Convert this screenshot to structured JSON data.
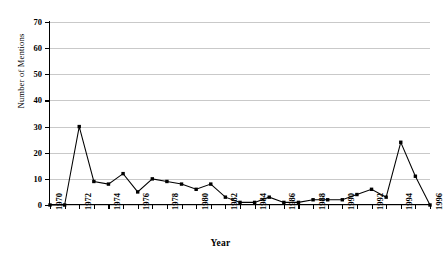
{
  "chart_data": {
    "type": "line",
    "title": "",
    "xlabel": "Year",
    "ylabel": "Number of Mentions",
    "xlim": [
      1970,
      1996
    ],
    "ylim": [
      0,
      70
    ],
    "ytick_step": 10,
    "xtick_step": 1,
    "xtick_label_step": 2,
    "grid": true,
    "legend": false,
    "marker": "filled-square",
    "line_color": "#000000",
    "grid_color": "#c9c9c9",
    "x": [
      1970,
      1971,
      1972,
      1973,
      1974,
      1975,
      1976,
      1977,
      1978,
      1979,
      1980,
      1981,
      1982,
      1983,
      1984,
      1985,
      1986,
      1987,
      1988,
      1989,
      1990,
      1991,
      1992,
      1993,
      1994,
      1995,
      1996
    ],
    "values": [
      0,
      0,
      30,
      9,
      8,
      12,
      5,
      10,
      9,
      8,
      6,
      8,
      3,
      1,
      1,
      3,
      1,
      1,
      2,
      2,
      2,
      4,
      6,
      3,
      24,
      11,
      0
    ],
    "ytick_labels": [
      "0",
      "10",
      "20",
      "30",
      "40",
      "50",
      "60",
      "70"
    ],
    "xtick_labels": [
      "1970",
      "1972",
      "1974",
      "1976",
      "1978",
      "1980",
      "1982",
      "1984",
      "1986",
      "1988",
      "1990",
      "1992",
      "1994",
      "1996"
    ]
  }
}
